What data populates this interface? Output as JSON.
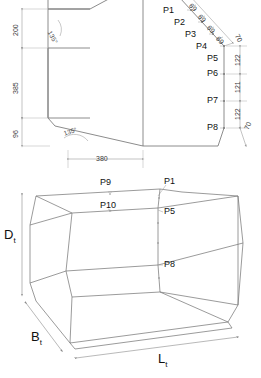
{
  "diagram": {
    "views": [
      {
        "name": "cross-section-view"
      },
      {
        "name": "isometric-view"
      }
    ]
  },
  "section_view": {
    "point_labels": [
      "P1",
      "P2",
      "P3",
      "P4",
      "P5",
      "P6",
      "P7",
      "P8"
    ],
    "left_dimensions": [
      "200",
      "385",
      "96"
    ],
    "bottom_dimension": "380",
    "angles": [
      "135°",
      "135°"
    ],
    "chamfer_dimensions": [
      "69",
      "69",
      "69",
      "69",
      "70"
    ],
    "right_dimensions": [
      "122",
      "121",
      "122",
      "70"
    ]
  },
  "iso_view": {
    "point_labels": [
      "P9",
      "P1",
      "P10",
      "P5",
      "P8"
    ],
    "dim_depth": "D",
    "dim_depth_sub": "t",
    "dim_breadth": "B",
    "dim_breadth_sub": "t",
    "dim_length": "L",
    "dim_length_sub": "t"
  },
  "colors": {
    "line": "#6e6e6e",
    "dim_line": "#9a9a9a",
    "text": "#111111"
  }
}
